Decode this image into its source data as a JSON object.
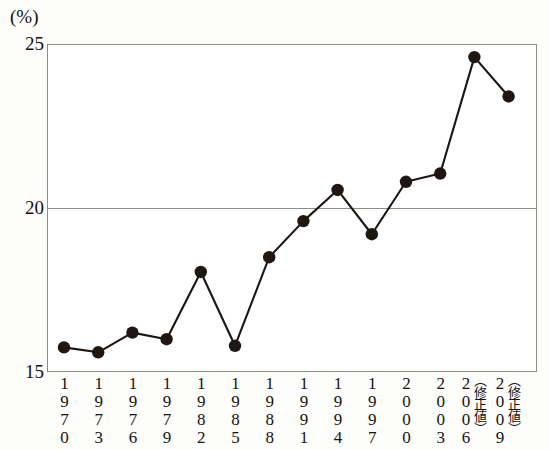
{
  "chart_data": {
    "type": "line",
    "title": "",
    "subtitle": "",
    "xlabel": "",
    "ylabel": "(%)",
    "unit_label": "(%)",
    "ylim": [
      15,
      25
    ],
    "yticks": [
      25,
      20,
      15
    ],
    "ytick_labels": [
      "25",
      "20",
      "15"
    ],
    "grid": "horizontal-at-20-only",
    "legend": "none",
    "marker": "filled-circle",
    "line_color": "#1c1512",
    "marker_color": "#1f1713",
    "frame_color": "#8d8d86",
    "categories": [
      "1970",
      "1973",
      "1976",
      "1979",
      "1982",
      "1985",
      "1988",
      "1991",
      "1994",
      "1997",
      "2000",
      "2003",
      "2006",
      "2009"
    ],
    "category_notes": [
      "",
      "",
      "",
      "",
      "",
      "",
      "",
      "",
      "",
      "",
      "",
      "",
      "（修正値）",
      "（修正値）"
    ],
    "values": [
      15.75,
      15.6,
      16.2,
      16.0,
      18.05,
      15.8,
      18.5,
      19.6,
      20.55,
      19.2,
      20.8,
      21.05,
      24.6,
      23.4
    ],
    "series": [
      {
        "name": "",
        "values": [
          15.75,
          15.6,
          16.2,
          16.0,
          18.05,
          15.8,
          18.5,
          19.6,
          20.55,
          19.2,
          20.8,
          21.05,
          24.6,
          23.4
        ]
      }
    ],
    "annotations": []
  }
}
